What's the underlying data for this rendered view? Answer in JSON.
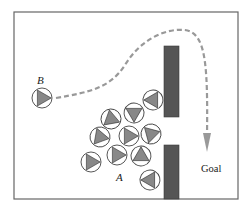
{
  "diagram": {
    "frame": {
      "x": 14,
      "y": 12,
      "width": 224,
      "height": 187,
      "stroke": "#666666"
    },
    "walls": [
      {
        "id": "wall-upper",
        "x": 164,
        "y": 46,
        "width": 15,
        "height": 71,
        "fill": "#555555"
      },
      {
        "id": "wall-lower",
        "x": 164,
        "y": 145,
        "width": 15,
        "height": 54,
        "fill": "#555555"
      }
    ],
    "robot_style": {
      "radius": 10,
      "circle_stroke": "#444444",
      "triangle_fill": "#888888",
      "triangle_stroke": "#333333"
    },
    "robot_b": {
      "label": "B",
      "x": 42,
      "y": 98,
      "heading": 0
    },
    "group_a": {
      "label": "A",
      "robots": [
        {
          "x": 153,
          "y": 100,
          "heading": -60
        },
        {
          "x": 134,
          "y": 113,
          "heading": -30
        },
        {
          "x": 111,
          "y": 119,
          "heading": 20
        },
        {
          "x": 100,
          "y": 137,
          "heading": 10
        },
        {
          "x": 129,
          "y": 136,
          "heading": 0
        },
        {
          "x": 151,
          "y": 134,
          "heading": -15
        },
        {
          "x": 117,
          "y": 155,
          "heading": 0
        },
        {
          "x": 91,
          "y": 162,
          "heading": 0
        },
        {
          "x": 141,
          "y": 156,
          "heading": 30
        },
        {
          "x": 150,
          "y": 180,
          "heading": -60
        }
      ]
    },
    "labels": {
      "b": {
        "text": "B",
        "x": 37,
        "y": 84
      },
      "a": {
        "text": "A",
        "x": 116,
        "y": 181
      },
      "goal": {
        "text": "Goal",
        "x": 201,
        "y": 172
      }
    },
    "path": {
      "d": "M 56 98 C 90 92, 110 88, 125 65 C 140 40, 165 28, 185 30 C 205 33, 208 60, 207 135",
      "stroke": "#999999",
      "dash": "5 3",
      "width": 2.2,
      "arrow_tip": {
        "x": 207,
        "y": 152
      },
      "arrow_color": "#999999"
    }
  }
}
